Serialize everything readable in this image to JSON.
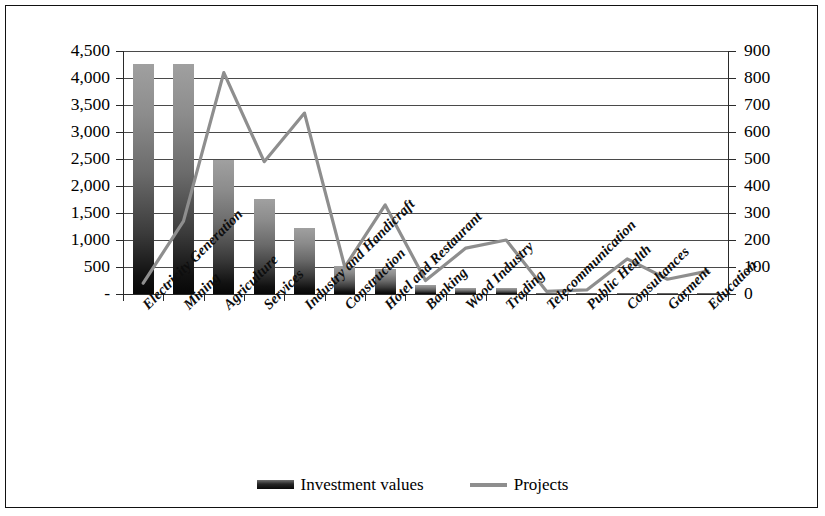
{
  "chart_data": {
    "type": "bar",
    "title": "",
    "xlabel": "",
    "categories": [
      "Electricity Generation",
      "Mining",
      "Agriculture",
      "Services",
      "Industry and Handicraft",
      "Construction",
      "Hotel and Restaurant",
      "Banking",
      "Wood Industry",
      "Trading",
      "Telecommunication",
      "Public Health",
      "Consultances",
      "Garment",
      "Education"
    ],
    "series": [
      {
        "name": "Investment values",
        "type": "bar",
        "axis": "left",
        "color": "#262626",
        "values": [
          4260,
          4260,
          2480,
          1760,
          1230,
          520,
          460,
          170,
          110,
          110,
          20,
          15,
          15,
          10,
          10
        ]
      },
      {
        "name": "Projects",
        "type": "line",
        "axis": "right",
        "color": "#8e8e8e",
        "values": [
          40,
          270,
          820,
          490,
          670,
          100,
          330,
          50,
          170,
          200,
          10,
          15,
          130,
          55,
          85
        ]
      }
    ],
    "left_axis": {
      "label": "",
      "ticks": [
        "-",
        "500",
        "1,000",
        "1,500",
        "2,000",
        "2,500",
        "3,000",
        "3,500",
        "4,000",
        "4,500"
      ],
      "min": 0,
      "max": 4500,
      "step": 500
    },
    "right_axis": {
      "label": "",
      "ticks": [
        "0",
        "100",
        "200",
        "300",
        "400",
        "500",
        "600",
        "700",
        "800",
        "900"
      ],
      "min": 0,
      "max": 900,
      "step": 100
    },
    "grid": true,
    "legend_position": "bottom"
  },
  "legend": {
    "items": [
      {
        "label": "Investment values",
        "marker": "bar-swatch"
      },
      {
        "label": "Projects",
        "marker": "line-swatch"
      }
    ]
  }
}
